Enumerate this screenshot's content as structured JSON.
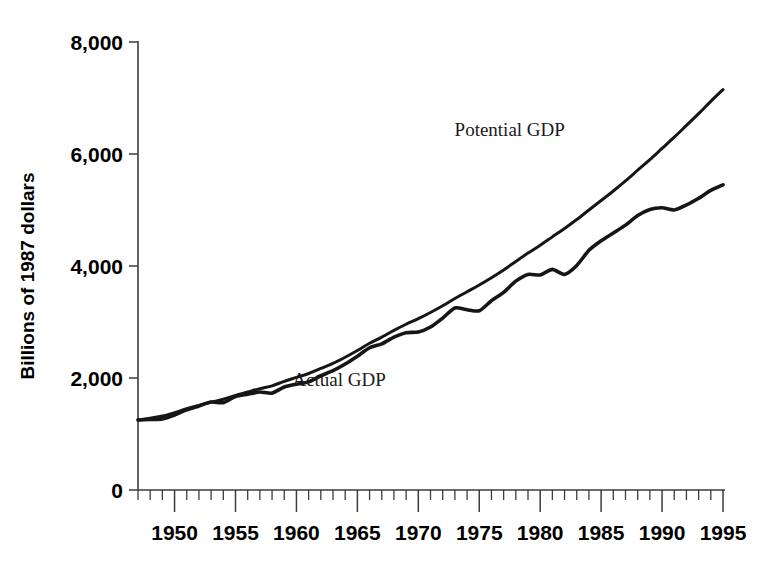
{
  "chart_data": {
    "type": "line",
    "title": "",
    "xlabel": "",
    "ylabel": "Billions of 1987 dollars",
    "xlim": [
      1947,
      1995
    ],
    "ylim": [
      0,
      8000
    ],
    "grid": false,
    "legend_position": "inline-annotation",
    "y_ticks": [
      {
        "value": 0,
        "label": "0"
      },
      {
        "value": 2000,
        "label": "2,000"
      },
      {
        "value": 4000,
        "label": "4,000"
      },
      {
        "value": 6000,
        "label": "6,000"
      },
      {
        "value": 8000,
        "label": "8,000"
      }
    ],
    "x_ticks_major": [
      {
        "value": 1950,
        "label": "1950"
      },
      {
        "value": 1955,
        "label": "1955"
      },
      {
        "value": 1960,
        "label": "1960"
      },
      {
        "value": 1965,
        "label": "1965"
      },
      {
        "value": 1970,
        "label": "1970"
      },
      {
        "value": 1975,
        "label": "1975"
      },
      {
        "value": 1980,
        "label": "1980"
      },
      {
        "value": 1985,
        "label": "1985"
      },
      {
        "value": 1990,
        "label": "1990"
      },
      {
        "value": 1995,
        "label": "1995"
      }
    ],
    "x_minor_tick_interval": 1,
    "series": [
      {
        "name": "Potential GDP",
        "annotation": "Potential GDP",
        "annotation_x": 1977.5,
        "annotation_y": 6330,
        "color": "#161616",
        "x": [
          1947,
          1948,
          1949,
          1950,
          1951,
          1952,
          1953,
          1954,
          1955,
          1956,
          1957,
          1958,
          1959,
          1960,
          1961,
          1962,
          1963,
          1964,
          1965,
          1966,
          1967,
          1968,
          1969,
          1970,
          1971,
          1972,
          1973,
          1974,
          1975,
          1976,
          1977,
          1978,
          1979,
          1980,
          1981,
          1982,
          1983,
          1984,
          1985,
          1986,
          1987,
          1988,
          1989,
          1990,
          1991,
          1992,
          1993,
          1994,
          1995
        ],
        "values": [
          1250,
          1280,
          1320,
          1380,
          1450,
          1510,
          1570,
          1620,
          1690,
          1750,
          1810,
          1860,
          1940,
          2010,
          2080,
          2170,
          2260,
          2370,
          2490,
          2620,
          2730,
          2850,
          2960,
          3060,
          3170,
          3290,
          3420,
          3540,
          3660,
          3790,
          3930,
          4080,
          4230,
          4370,
          4520,
          4670,
          4830,
          5000,
          5170,
          5340,
          5520,
          5710,
          5900,
          6100,
          6300,
          6510,
          6720,
          6940,
          7150
        ]
      },
      {
        "name": "Actual GDP",
        "annotation": "Actual GDP",
        "annotation_x": 1963.5,
        "annotation_y": 1860,
        "color": "#161616",
        "x": [
          1947,
          1948,
          1949,
          1950,
          1951,
          1952,
          1953,
          1954,
          1955,
          1956,
          1957,
          1958,
          1959,
          1960,
          1961,
          1962,
          1963,
          1964,
          1965,
          1966,
          1967,
          1968,
          1969,
          1970,
          1971,
          1972,
          1973,
          1974,
          1975,
          1976,
          1977,
          1978,
          1979,
          1980,
          1981,
          1982,
          1983,
          1984,
          1985,
          1986,
          1987,
          1988,
          1989,
          1990,
          1991,
          1992,
          1993,
          1994,
          1995
        ],
        "values": [
          1250,
          1260,
          1270,
          1340,
          1430,
          1500,
          1570,
          1560,
          1670,
          1710,
          1750,
          1730,
          1840,
          1890,
          1930,
          2040,
          2130,
          2250,
          2390,
          2540,
          2610,
          2730,
          2810,
          2820,
          2910,
          3070,
          3250,
          3220,
          3200,
          3380,
          3530,
          3730,
          3850,
          3840,
          3940,
          3850,
          4010,
          4280,
          4450,
          4590,
          4730,
          4900,
          5010,
          5040,
          5000,
          5090,
          5210,
          5350,
          5450
        ]
      }
    ]
  }
}
